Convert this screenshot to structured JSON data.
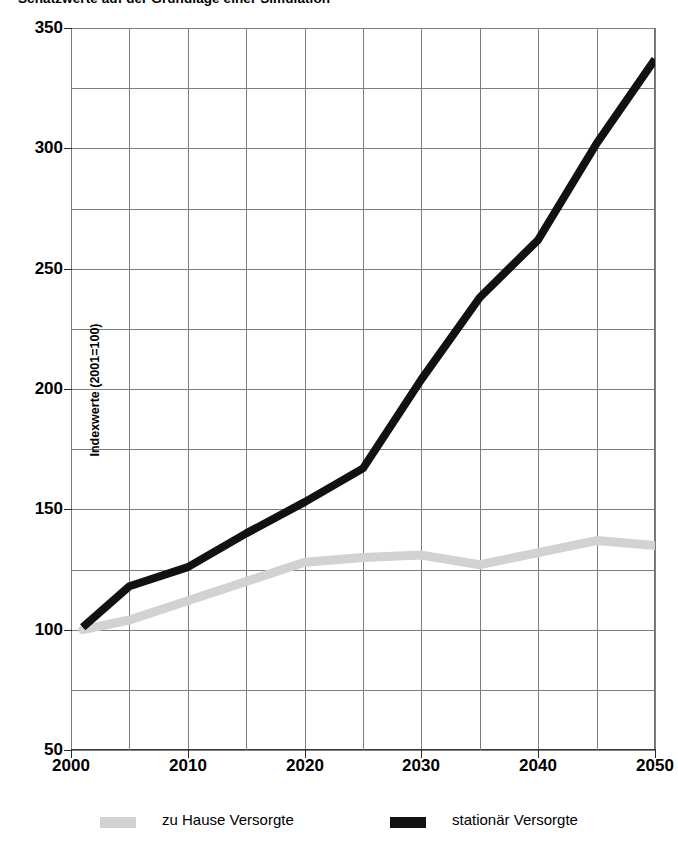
{
  "chart_data": {
    "type": "line",
    "title": "Schätzwerte auf der Grundlage einer Simulation",
    "xlabel": "",
    "ylabel": "Indexwerte (2001=100)",
    "xlim": [
      2000,
      2050
    ],
    "ylim": [
      50,
      350
    ],
    "ytick_step": 50,
    "xtick_step": 10,
    "y_minor_step": 25,
    "x_minor_step": 5,
    "grid": true,
    "legend_position": "bottom",
    "yticks": [
      "50",
      "100",
      "150",
      "200",
      "250",
      "300",
      "350"
    ],
    "xticks": [
      "2000",
      "2010",
      "2020",
      "2030",
      "2040",
      "2050"
    ],
    "x": [
      2001,
      2005,
      2010,
      2015,
      2020,
      2025,
      2030,
      2035,
      2040,
      2045,
      2050
    ],
    "series": [
      {
        "name": "zu Hause Versorgte",
        "color": "#d2d2d2",
        "values": [
          100,
          104,
          112,
          120,
          128,
          130,
          131,
          127,
          132,
          137,
          135
        ]
      },
      {
        "name": "stationär Versorgte",
        "color": "#111111",
        "values": [
          101,
          118,
          126,
          140,
          153,
          167,
          204,
          238,
          262,
          302,
          337
        ]
      }
    ]
  },
  "title": {
    "text": "Schätzwerte auf der Grundlage einer Simulation"
  },
  "axes": {
    "y_title": "Indexwerte (2001=100)",
    "y_ticks": [
      {
        "label": "350",
        "value": 350
      },
      {
        "label": "300",
        "value": 300
      },
      {
        "label": "250",
        "value": 250
      },
      {
        "label": "200",
        "value": 200
      },
      {
        "label": "150",
        "value": 150
      },
      {
        "label": "100",
        "value": 100
      },
      {
        "label": "50",
        "value": 50
      }
    ],
    "x_ticks": [
      {
        "label": "2000",
        "value": 2000
      },
      {
        "label": "2010",
        "value": 2010
      },
      {
        "label": "2020",
        "value": 2020
      },
      {
        "label": "2030",
        "value": 2030
      },
      {
        "label": "2040",
        "value": 2040
      },
      {
        "label": "2050",
        "value": 2050
      }
    ]
  },
  "legend": {
    "items": [
      {
        "label": "zu Hause Versorgte",
        "color": "#d2d2d2"
      },
      {
        "label": "stationär Versorgte",
        "color": "#111111"
      }
    ]
  }
}
